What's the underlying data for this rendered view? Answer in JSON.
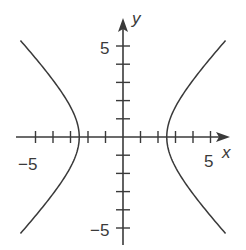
{
  "chart_data": {
    "type": "line",
    "title": "",
    "xlabel": "x",
    "ylabel": "y",
    "xlim": [
      -6,
      6
    ],
    "ylim": [
      -5.5,
      5.5
    ],
    "grid": false,
    "legend": null,
    "tick_step": 1,
    "x_tick_labels": [
      {
        "value": -5,
        "label": "−5"
      },
      {
        "value": 5,
        "label": "5"
      }
    ],
    "y_tick_labels": [
      {
        "value": 5,
        "label": "5"
      },
      {
        "value": -5,
        "label": "−5"
      }
    ],
    "series": [
      {
        "name": "hyperbola",
        "equation": "x^2/6.25 - y^2/6.25 = 1",
        "a": 2.5,
        "b": 2.5,
        "vertices": [
          [
            -2.5,
            0
          ],
          [
            2.5,
            0
          ]
        ],
        "branches": [
          "left",
          "right"
        ],
        "y_range": [
          -5.3,
          5.3
        ]
      }
    ],
    "colors": {
      "curve": "#3a3a3a",
      "axes": "#3a3a3a"
    }
  }
}
